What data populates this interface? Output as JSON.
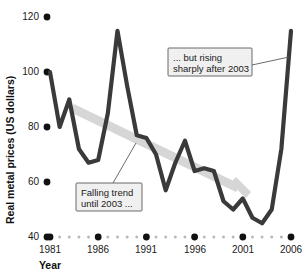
{
  "chart_data": {
    "type": "line",
    "title": "",
    "xlabel": "Year",
    "ylabel": "Real metal prices (US dollars)",
    "xlim": [
      1981,
      2006
    ],
    "ylim": [
      40,
      120
    ],
    "grid": false,
    "legend": "none",
    "y_ticks": [
      40,
      60,
      80,
      100,
      120
    ],
    "y_tick_labels": [
      "40",
      "60",
      "80",
      "100",
      "120"
    ],
    "x_ticks": [
      1981,
      1986,
      1991,
      1996,
      2001,
      2006
    ],
    "x_tick_labels": [
      "1981",
      "1986",
      "1991",
      "1996",
      "2001",
      "2006"
    ],
    "x_minor_ticks": [
      1982,
      1983,
      1984,
      1985,
      1987,
      1988,
      1989,
      1990,
      1992,
      1993,
      1994,
      1995,
      1997,
      1998,
      1999,
      2000,
      2002,
      2003,
      2004,
      2005
    ],
    "series": [
      {
        "name": "Real metal prices",
        "color": "#3a3a3a",
        "x": [
          1981,
          1982,
          1983,
          1984,
          1985,
          1986,
          1987,
          1988,
          1989,
          1990,
          1991,
          1992,
          1993,
          1994,
          1995,
          1996,
          1997,
          1998,
          1999,
          2000,
          2001,
          2002,
          2003,
          2004,
          2005,
          2006
        ],
        "values": [
          100,
          80,
          90,
          72,
          67,
          68,
          85,
          115,
          95,
          77,
          76,
          70,
          57,
          67,
          75,
          64,
          65,
          64,
          53,
          50,
          54,
          47,
          45,
          50,
          72,
          115
        ]
      }
    ],
    "annotations": [
      {
        "id": "falling-trend",
        "text_lines": [
          "Falling trend",
          "until 2003 ..."
        ],
        "box_x": 76,
        "box_y": 183,
        "box_w": 66,
        "box_h": 28,
        "leader": [
          [
            113,
            183
          ],
          [
            136,
            143
          ]
        ]
      },
      {
        "id": "rising-sharply",
        "text_lines": [
          "... but rising",
          "sharply after 2003"
        ],
        "box_x": 168,
        "box_y": 48,
        "box_w": 84,
        "box_h": 28,
        "leader": [
          [
            252,
            65
          ],
          [
            289,
            57
          ]
        ]
      }
    ],
    "trend_arrow": {
      "id": "falling-trend-arrow",
      "color": "#d6d6d6",
      "from": [
        72,
        108
      ],
      "to": [
        238,
        188
      ],
      "head": [
        [
          246,
          198
        ],
        [
          230,
          183
        ],
        [
          236,
          177
        ],
        [
          251,
          192
        ]
      ]
    }
  }
}
